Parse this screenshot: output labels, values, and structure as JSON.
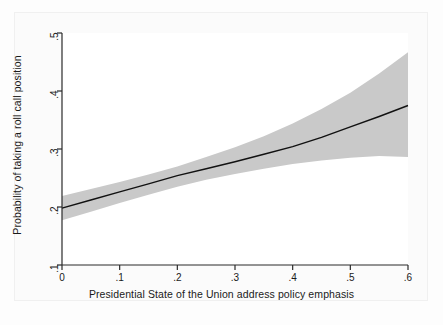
{
  "figure": {
    "background_color": "#fdfdfd",
    "plot_background_color": "#ffffff",
    "axis_color": "#2b2b2b",
    "line_color": "#111111",
    "band_color": "#c9c9c9"
  },
  "chart_data": {
    "type": "line",
    "title": "",
    "xlabel": "Presidential State of the Union address policy emphasis",
    "ylabel": "Probability of taking a roll call position",
    "xlim": [
      0,
      0.6
    ],
    "ylim": [
      0.1,
      0.5
    ],
    "xticks": [
      0,
      0.1,
      0.2,
      0.3,
      0.4,
      0.5,
      0.6
    ],
    "xtick_labels": [
      "0",
      ".1",
      ".2",
      ".3",
      ".4",
      ".5",
      ".6"
    ],
    "yticks": [
      0.1,
      0.2,
      0.3,
      0.4,
      0.5
    ],
    "ytick_labels": [
      ".1",
      ".2",
      ".3",
      ".4",
      ".5"
    ],
    "grid": false,
    "legend": null,
    "x": [
      0,
      0.05,
      0.1,
      0.15,
      0.2,
      0.25,
      0.3,
      0.35,
      0.4,
      0.45,
      0.5,
      0.55,
      0.6
    ],
    "series": [
      {
        "name": "Predicted probability",
        "style": "solid-line",
        "values": [
          0.198,
          0.212,
          0.226,
          0.24,
          0.254,
          0.266,
          0.278,
          0.291,
          0.304,
          0.32,
          0.338,
          0.356,
          0.375
        ]
      },
      {
        "name": "95% confidence interval upper bound",
        "style": "shaded-band-edge",
        "values": [
          0.219,
          0.231,
          0.243,
          0.256,
          0.27,
          0.286,
          0.303,
          0.322,
          0.344,
          0.369,
          0.397,
          0.43,
          0.467
        ]
      },
      {
        "name": "95% confidence interval lower bound",
        "style": "shaded-band-edge",
        "values": [
          0.177,
          0.192,
          0.207,
          0.221,
          0.235,
          0.247,
          0.257,
          0.266,
          0.274,
          0.28,
          0.285,
          0.288,
          0.286
        ]
      }
    ]
  }
}
